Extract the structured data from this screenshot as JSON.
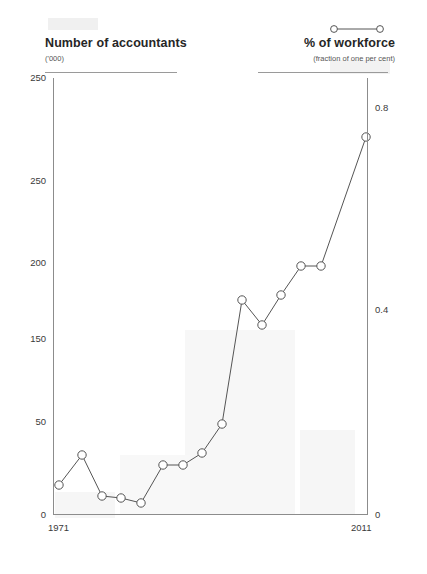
{
  "header": {
    "left_title": "Number of accountants",
    "left_subtitle": "('000)",
    "right_title": "% of workforce",
    "right_subtitle": "(fraction of one per cent)"
  },
  "legend": {
    "marker_icon": "line-with-open-circles-icon",
    "series_label": "% of workforce"
  },
  "chart_data": {
    "type": "line",
    "title": "Number of accountants",
    "subtitle": "('000)",
    "xlabel": "",
    "ylabel": "Number of accountants ('000)",
    "y2label": "% of workforce (fraction of one per cent)",
    "grid": false,
    "legend_position": "top-right",
    "marker": "open-circle",
    "line_color": "#555555",
    "marker_color": "#555555",
    "x": [
      1971,
      1974,
      1977,
      1980,
      1983,
      1986,
      1989,
      1992,
      1995,
      1998,
      2001,
      2004,
      2007,
      2009,
      2011
    ],
    "x_tick_labels": [
      "1971",
      "2011"
    ],
    "xlim": [
      1971,
      2011
    ],
    "ylim": [
      0,
      270
    ],
    "y_tick_labels": [
      "250",
      "250",
      "200",
      "150",
      "50",
      "0"
    ],
    "y_tick_values": [
      270,
      250,
      200,
      150,
      50,
      0
    ],
    "y2lim": [
      0,
      0.86
    ],
    "y2_tick_labels": [
      "0.8",
      "0.4",
      "0"
    ],
    "y2_tick_values": [
      0.8,
      0.4,
      0
    ],
    "series": [
      {
        "name": "% of workforce",
        "units": "per cent of workforce",
        "values": [
          0.055,
          0.085,
          0.045,
          0.043,
          0.038,
          0.075,
          0.075,
          0.095,
          0.125,
          0.415,
          0.335,
          0.385,
          0.445,
          0.445,
          0.745
        ]
      }
    ],
    "series_left_axis_equivalent": {
      "name": "Number of accountants ('000)",
      "values": [
        18,
        29,
        15,
        14,
        13,
        29,
        29,
        32,
        46,
        167,
        139,
        158,
        181,
        181,
        281
      ]
    },
    "annotations": []
  },
  "axes": {
    "left_ticks": [
      {
        "label": "250",
        "pos": 0.0
      },
      {
        "label": "250",
        "pos": 0.2346
      },
      {
        "label": "200",
        "pos": 0.4235
      },
      {
        "label": "150",
        "pos": 0.5965
      },
      {
        "label": "50",
        "pos": 0.7878
      },
      {
        "label": "0",
        "pos": 1.0
      }
    ],
    "right_ticks": [
      {
        "label": "0.8",
        "pos": 0.0686
      },
      {
        "label": "0.4",
        "pos": 0.5309
      },
      {
        "label": "0",
        "pos": 1.0
      }
    ],
    "x_labels": {
      "start": "1971",
      "end": "2011"
    }
  },
  "points": [
    {
      "cx": 0.019,
      "cy": 0.9314
    },
    {
      "cx": 0.0921,
      "cy": 0.8627
    },
    {
      "cx": 0.1556,
      "cy": 0.9565
    },
    {
      "cx": 0.2159,
      "cy": 0.9611
    },
    {
      "cx": 0.2794,
      "cy": 0.9725
    },
    {
      "cx": 0.3492,
      "cy": 0.8856
    },
    {
      "cx": 0.4127,
      "cy": 0.8856
    },
    {
      "cx": 0.473,
      "cy": 0.8581
    },
    {
      "cx": 0.5365,
      "cy": 0.7918
    },
    {
      "cx": 0.6,
      "cy": 0.508
    },
    {
      "cx": 0.6635,
      "cy": 0.5652
    },
    {
      "cx": 0.7238,
      "cy": 0.4966
    },
    {
      "cx": 0.7873,
      "cy": 0.4302
    },
    {
      "cx": 0.8508,
      "cy": 0.4302
    },
    {
      "cx": 0.9937,
      "cy": 0.135
    }
  ]
}
